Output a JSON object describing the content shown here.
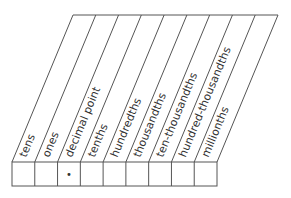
{
  "diagram": {
    "type": "place-value-chart",
    "columns": [
      {
        "label": "tens",
        "cell": ""
      },
      {
        "label": "ones",
        "cell": ""
      },
      {
        "label": "decimal point",
        "cell": "•"
      },
      {
        "label": "tenths",
        "cell": ""
      },
      {
        "label": "hundredths",
        "cell": ""
      },
      {
        "label": "thousandths",
        "cell": ""
      },
      {
        "label": "ten-thousandths",
        "cell": ""
      },
      {
        "label": "hundred-thousandths",
        "cell": ""
      },
      {
        "label": "millionths",
        "cell": ""
      }
    ],
    "colors": {
      "line": "#555555",
      "text": "#333333"
    }
  }
}
